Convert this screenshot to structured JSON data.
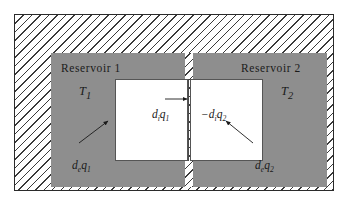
{
  "figure": {
    "colors": {
      "reservoir_fill": "#8e8e8e",
      "chamber_fill": "#ffffff",
      "hatch_line": "#3a3a3a",
      "frame_border": "#2b2b2b",
      "text": "#1a1a1a",
      "background": "#ffffff"
    }
  },
  "reservoirs": [
    {
      "title": "Reservoir 1",
      "temperature_symbol": "T",
      "temperature_subscript": "1"
    },
    {
      "title": "Reservoir 2",
      "temperature_symbol": "T",
      "temperature_subscript": "2"
    }
  ],
  "labels": {
    "internal_flux_left": "d",
    "internal_flux_left_sub": "i",
    "internal_flux_left_q": "q",
    "internal_flux_left_qsub": "1",
    "internal_flux_right_sign": "−",
    "internal_flux_right": "d",
    "internal_flux_right_sub": "i",
    "internal_flux_right_q": "q",
    "internal_flux_right_qsub": "2",
    "external_flux_1": "d",
    "external_flux_1_sub": "e",
    "external_flux_1_q": "q",
    "external_flux_1_qsub": "1",
    "external_flux_2": "d",
    "external_flux_2_sub": "e",
    "external_flux_2_q": "q",
    "external_flux_2_qsub": "2"
  },
  "arrows": [
    {
      "name": "internal-heat-flow-arrow",
      "direction": "right",
      "from": "d_i q_1",
      "to": "-d_i q_2"
    },
    {
      "name": "external-flux-1-arrow",
      "direction": "up-right",
      "from": "d_e q_1",
      "to": "chamber-1"
    },
    {
      "name": "external-flux-2-arrow",
      "direction": "up-left",
      "from": "d_e q_2",
      "to": "chamber-2"
    }
  ]
}
